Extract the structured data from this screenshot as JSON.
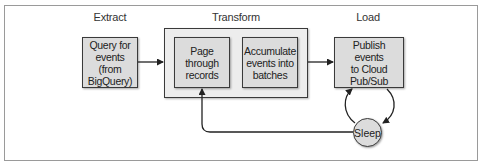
{
  "diagram": {
    "stages": {
      "extract": "Extract",
      "transform": "Transform",
      "load": "Load"
    },
    "nodes": {
      "query": "Query for\nevents (from\nBigQuery)",
      "page": "Page\nthrough\nrecords",
      "accumulate": "Accumulate\nevents into\nbatches",
      "publish": "Publish events\nto Cloud\nPub/Sub",
      "sleep": "Sleep"
    },
    "edges": [
      {
        "from": "query",
        "to": "transform-group"
      },
      {
        "from": "transform-group",
        "to": "publish"
      },
      {
        "from": "publish",
        "to": "sleep"
      },
      {
        "from": "sleep",
        "to": "publish"
      },
      {
        "from": "sleep",
        "to": "page"
      }
    ],
    "colors": {
      "box_fill": "#dcdcdc",
      "group_fill": "#ededed",
      "stroke": "#3a3a3a"
    }
  }
}
